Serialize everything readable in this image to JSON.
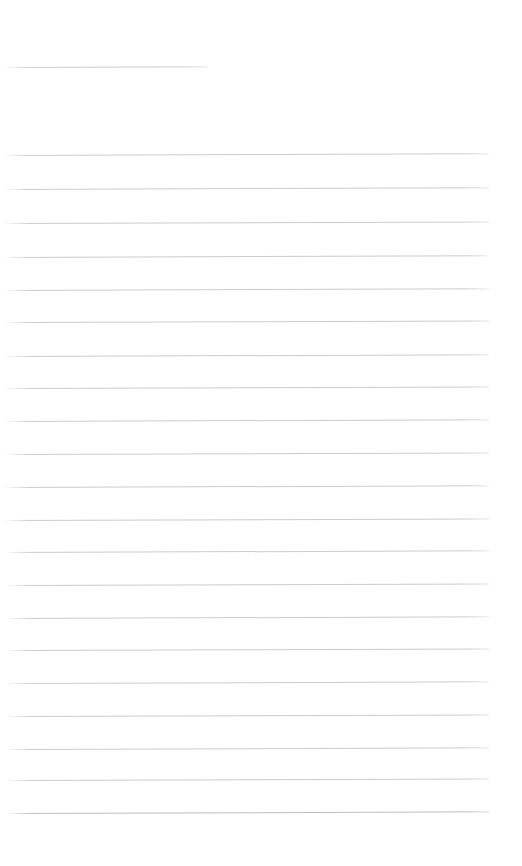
{
  "document": {
    "kind": "scanned-ruled-page",
    "title": "Blank ruled page",
    "page_width": 522,
    "page_height": 866,
    "background_color": "#ffffff",
    "rule_color": "#c9c9ce",
    "rule_color_emphasis": "#b9b9c0",
    "visible_text": "",
    "text_lines": [],
    "top_margin_height": 60,
    "left_margin_x": 4,
    "right_margin_x": 490
  },
  "rules": [
    {
      "id": "rule-header",
      "label": "header-rule",
      "y": 67,
      "x1": 4,
      "x2": 208,
      "weight": "light",
      "skew_deg": -0.22
    },
    {
      "id": "rule-1",
      "label": "body-rule-1",
      "y": 155,
      "x1": 3,
      "x2": 489,
      "weight": "light",
      "skew_deg": -0.2
    },
    {
      "id": "rule-2",
      "label": "body-rule-2",
      "y": 189,
      "x1": 3,
      "x2": 489,
      "weight": "light",
      "skew_deg": -0.2
    },
    {
      "id": "rule-3",
      "label": "body-rule-3",
      "y": 223,
      "x1": 3,
      "x2": 489,
      "weight": "light",
      "skew_deg": -0.18
    },
    {
      "id": "rule-4",
      "label": "body-rule-4",
      "y": 257,
      "x1": 3,
      "x2": 489,
      "weight": "light",
      "skew_deg": -0.2
    },
    {
      "id": "rule-5",
      "label": "body-rule-5",
      "y": 290,
      "x1": 3,
      "x2": 489,
      "weight": "light",
      "skew_deg": -0.22
    },
    {
      "id": "rule-6",
      "label": "body-rule-6",
      "y": 322,
      "x1": 4,
      "x2": 489,
      "weight": "light",
      "skew_deg": -0.18
    },
    {
      "id": "rule-7",
      "label": "body-rule-7",
      "y": 356,
      "x1": 4,
      "x2": 489,
      "weight": "light",
      "skew_deg": -0.2
    },
    {
      "id": "rule-8",
      "label": "body-rule-8",
      "y": 388,
      "x1": 4,
      "x2": 489,
      "weight": "light",
      "skew_deg": -0.18
    },
    {
      "id": "rule-9",
      "label": "body-rule-9",
      "y": 421,
      "x1": 4,
      "x2": 489,
      "weight": "light",
      "skew_deg": -0.2
    },
    {
      "id": "rule-10",
      "label": "body-rule-10",
      "y": 454,
      "x1": 4,
      "x2": 489,
      "weight": "light",
      "skew_deg": -0.18
    },
    {
      "id": "rule-11",
      "label": "body-rule-11",
      "y": 487,
      "x1": 4,
      "x2": 489,
      "weight": "light",
      "skew_deg": -0.2
    },
    {
      "id": "rule-12",
      "label": "body-rule-12",
      "y": 520,
      "x1": 4,
      "x2": 489,
      "weight": "light",
      "skew_deg": -0.18
    },
    {
      "id": "rule-13",
      "label": "body-rule-13",
      "y": 552,
      "x1": 5,
      "x2": 489,
      "weight": "light",
      "skew_deg": -0.2
    },
    {
      "id": "rule-14",
      "label": "body-rule-14",
      "y": 585,
      "x1": 5,
      "x2": 489,
      "weight": "light",
      "skew_deg": -0.18
    },
    {
      "id": "rule-15",
      "label": "body-rule-15",
      "y": 618,
      "x1": 5,
      "x2": 489,
      "weight": "light",
      "skew_deg": -0.2
    },
    {
      "id": "rule-16",
      "label": "body-rule-16",
      "y": 650,
      "x1": 5,
      "x2": 489,
      "weight": "light",
      "skew_deg": -0.18
    },
    {
      "id": "rule-17",
      "label": "body-rule-17",
      "y": 683,
      "x1": 6,
      "x2": 489,
      "weight": "light",
      "skew_deg": -0.2
    },
    {
      "id": "rule-18",
      "label": "body-rule-18",
      "y": 716,
      "x1": 6,
      "x2": 489,
      "weight": "light",
      "skew_deg": -0.18
    },
    {
      "id": "rule-19",
      "label": "body-rule-19",
      "y": 749,
      "x1": 6,
      "x2": 489,
      "weight": "light",
      "skew_deg": -0.2
    },
    {
      "id": "rule-20",
      "label": "body-rule-20",
      "y": 780,
      "x1": 6,
      "x2": 489,
      "weight": "light",
      "skew_deg": -0.18
    },
    {
      "id": "rule-21",
      "label": "body-rule-21",
      "y": 813,
      "x1": 6,
      "x2": 490,
      "weight": "strong",
      "skew_deg": -0.2
    }
  ]
}
